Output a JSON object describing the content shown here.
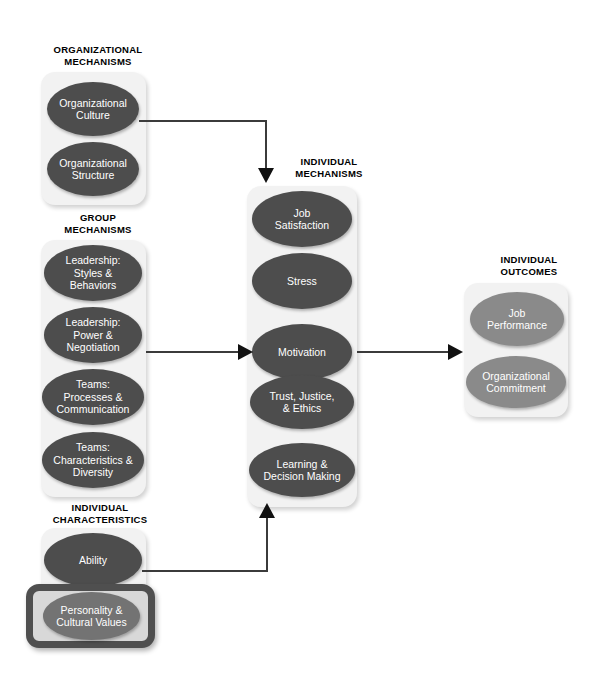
{
  "diagram": {
    "colors": {
      "panel_background": "#f2f2f2",
      "oval_dark": "#4d4d4d",
      "oval_light": "#8a8a8a",
      "highlight_border": "#4f4f4f",
      "line": "#3b3b3b",
      "text_on_oval": "#ffffff",
      "label_text": "#000000"
    },
    "sections": [
      {
        "id": "organizational-mechanisms",
        "label": "ORGANIZATIONAL\nMECHANISMS",
        "nodes": [
          {
            "id": "organizational-culture",
            "label": "Organizational\nCulture",
            "shade": "dark"
          },
          {
            "id": "organizational-structure",
            "label": "Organizational\nStructure",
            "shade": "dark"
          }
        ]
      },
      {
        "id": "group-mechanisms",
        "label": "GROUP\nMECHANISMS",
        "nodes": [
          {
            "id": "leadership-styles-behaviors",
            "label": "Leadership:\nStyles &\nBehaviors",
            "shade": "dark"
          },
          {
            "id": "leadership-power-negotiation",
            "label": "Leadership:\nPower &\nNegotiation",
            "shade": "dark"
          },
          {
            "id": "teams-processes-communication",
            "label": "Teams:\nProcesses &\nCommunication",
            "shade": "dark"
          },
          {
            "id": "teams-characteristics-diversity",
            "label": "Teams:\nCharacteristics &\nDiversity",
            "shade": "dark"
          }
        ]
      },
      {
        "id": "individual-characteristics",
        "label": "INDIVIDUAL\nCHARACTERISTICS",
        "nodes": [
          {
            "id": "ability",
            "label": "Ability",
            "shade": "dark"
          },
          {
            "id": "personality-cultural-values",
            "label": "Personality  &\nCultural Values",
            "shade": "mid",
            "highlighted": true
          }
        ]
      },
      {
        "id": "individual-mechanisms",
        "label": "INDIVIDUAL\nMECHANISMS",
        "nodes": [
          {
            "id": "job-satisfaction",
            "label": "Job\nSatisfaction",
            "shade": "dark"
          },
          {
            "id": "stress",
            "label": "Stress",
            "shade": "dark"
          },
          {
            "id": "motivation",
            "label": "Motivation",
            "shade": "dark"
          },
          {
            "id": "trust-justice-ethics",
            "label": "Trust, Justice,\n& Ethics",
            "shade": "dark"
          },
          {
            "id": "learning-decision-making",
            "label": "Learning &\nDecision Making",
            "shade": "dark"
          }
        ]
      },
      {
        "id": "individual-outcomes",
        "label": "INDIVIDUAL\nOUTCOMES",
        "nodes": [
          {
            "id": "job-performance",
            "label": "Job\nPerformance",
            "shade": "light"
          },
          {
            "id": "organizational-commitment",
            "label": "Organizational\nCommitment",
            "shade": "light"
          }
        ]
      }
    ],
    "connections": [
      {
        "id": "org-to-individual-mechanisms",
        "from": "organizational-mechanisms",
        "to": "individual-mechanisms",
        "arrow": "down"
      },
      {
        "id": "group-to-individual-mechanisms",
        "from": "group-mechanisms",
        "to": "individual-mechanisms",
        "arrow": "right"
      },
      {
        "id": "characteristics-to-individual-mechanisms",
        "from": "individual-characteristics",
        "to": "individual-mechanisms",
        "arrow": "up"
      },
      {
        "id": "mechanisms-to-outcomes",
        "from": "individual-mechanisms",
        "to": "individual-outcomes",
        "arrow": "right"
      }
    ]
  }
}
